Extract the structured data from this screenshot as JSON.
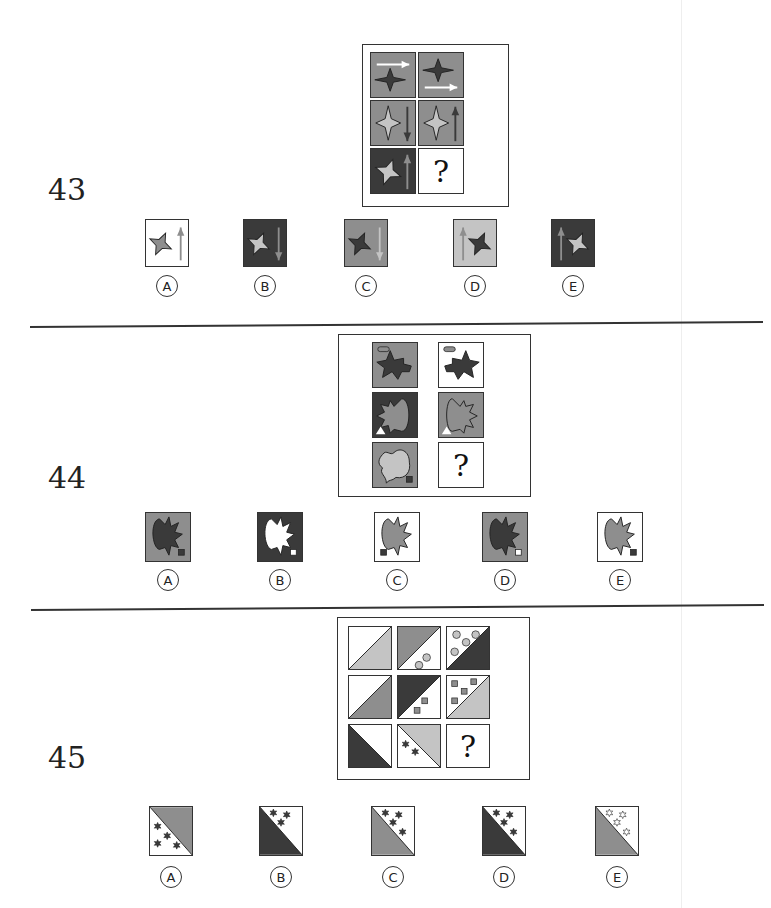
{
  "colors": {
    "dark": "#3a3a3a",
    "mid": "#8e8e8e",
    "light": "#c4c4c4",
    "white": "#ffffff",
    "line": "#333333"
  },
  "questions": [
    {
      "number": "43",
      "grid": [
        {
          "bg": "mid",
          "shape": "star4",
          "shape_fill": "dark",
          "arrow": "right",
          "arrow_pos": "top",
          "arrow_color": "white"
        },
        {
          "bg": "mid",
          "shape": "star4",
          "shape_fill": "dark",
          "arrow": "right",
          "arrow_pos": "bottom",
          "arrow_color": "white"
        },
        {
          "bg": "mid",
          "shape": "star4-tall",
          "shape_fill": "light",
          "arrow": "down",
          "arrow_pos": "right",
          "arrow_color": "dark"
        },
        {
          "bg": "mid",
          "shape": "star4-tall",
          "shape_fill": "light",
          "arrow": "up",
          "arrow_pos": "right",
          "arrow_color": "dark"
        },
        {
          "bg": "dark",
          "shape": "star4-skew",
          "shape_fill": "light",
          "arrow": "up",
          "arrow_pos": "right",
          "arrow_color": "mid"
        },
        {
          "bg": "white",
          "question": "?"
        }
      ],
      "options": [
        {
          "letter": "A",
          "bg": "white",
          "shape_fill": "mid",
          "arrow": "up",
          "arrow_pos": "right",
          "arrow_color": "mid"
        },
        {
          "letter": "B",
          "bg": "dark",
          "shape_fill": "light",
          "arrow": "down",
          "arrow_pos": "right",
          "arrow_color": "mid"
        },
        {
          "letter": "C",
          "bg": "mid",
          "shape_fill": "dark",
          "arrow": "down",
          "arrow_pos": "right",
          "arrow_color": "light"
        },
        {
          "letter": "D",
          "bg": "light",
          "shape_fill": "dark",
          "arrow": "up",
          "arrow_pos": "left",
          "arrow_color": "mid"
        },
        {
          "letter": "E",
          "bg": "dark",
          "shape_fill": "light",
          "arrow": "up",
          "arrow_pos": "left",
          "arrow_color": "mid"
        }
      ]
    },
    {
      "number": "44",
      "grid": [
        {
          "bg": "mid",
          "shape": "star-cross",
          "shape_fill": "dark",
          "marker": "pill",
          "marker_fill": "mid"
        },
        {
          "bg": "white",
          "shape": "star-cross-mirror",
          "shape_fill": "dark",
          "marker": "pill",
          "marker_fill": "mid"
        },
        {
          "bg": "dark",
          "shape": "burst-blob",
          "shape_fill": "mid",
          "marker": "triangle",
          "marker_fill": "white"
        },
        {
          "bg": "mid",
          "shape": "blob-burst",
          "shape_fill": "mid",
          "marker": "triangle",
          "marker_fill": "white"
        },
        {
          "bg": "mid",
          "shape": "cloud",
          "shape_fill": "light",
          "marker": "square",
          "marker_fill": "dark"
        },
        {
          "bg": "white",
          "question": "?"
        }
      ],
      "options": [
        {
          "letter": "A",
          "bg": "mid",
          "shape_fill": "dark",
          "marker": "square",
          "marker_fill": "dark",
          "marker_pos": "right"
        },
        {
          "letter": "B",
          "bg": "dark",
          "shape_fill": "white",
          "marker": "square",
          "marker_fill": "white",
          "marker_pos": "right"
        },
        {
          "letter": "C",
          "bg": "white",
          "shape_fill": "mid",
          "marker": "square",
          "marker_fill": "dark",
          "marker_pos": "left"
        },
        {
          "letter": "D",
          "bg": "mid",
          "shape_fill": "dark",
          "marker": "square",
          "marker_fill": "white",
          "marker_pos": "right"
        },
        {
          "letter": "E",
          "bg": "white",
          "shape_fill": "mid",
          "marker": "square",
          "marker_fill": "dark",
          "marker_pos": "right"
        }
      ]
    },
    {
      "number": "45",
      "grid": [
        {
          "diag": "up",
          "a": "white",
          "b": "light",
          "dots": "none"
        },
        {
          "diag": "up",
          "a": "mid",
          "b": "white",
          "dots": "circles-2"
        },
        {
          "diag": "up",
          "a": "white",
          "b": "dark",
          "dots": "circles-4"
        },
        {
          "diag": "up",
          "a": "white",
          "b": "mid",
          "dots": "none"
        },
        {
          "diag": "up",
          "a": "dark",
          "b": "white",
          "dots": "squares-2"
        },
        {
          "diag": "up",
          "a": "white",
          "b": "light",
          "dots": "squares-4"
        },
        {
          "diag": "down",
          "a": "white",
          "b": "dark",
          "dots": "none"
        },
        {
          "diag": "down",
          "a": "light",
          "b": "white",
          "dots": "stars-2"
        },
        {
          "question": "?"
        }
      ],
      "options": [
        {
          "letter": "A",
          "upper": "mid",
          "lower": "white",
          "stars": "lower",
          "star_fill": "dark",
          "count": 4
        },
        {
          "letter": "B",
          "upper": "white",
          "lower": "dark",
          "stars": "upper",
          "star_fill": "dark",
          "count": 3
        },
        {
          "letter": "C",
          "upper": "white",
          "lower": "mid",
          "stars": "upper",
          "star_fill": "dark",
          "count": 4
        },
        {
          "letter": "D",
          "upper": "white",
          "lower": "dark",
          "stars": "upper",
          "star_fill": "dark",
          "count": 4
        },
        {
          "letter": "E",
          "upper": "white",
          "lower": "mid",
          "stars": "upper",
          "star_fill": "white",
          "count": 4
        }
      ]
    }
  ]
}
